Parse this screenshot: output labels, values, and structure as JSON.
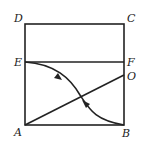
{
  "diagram": {
    "points": {
      "A": {
        "label": "A",
        "x": 25,
        "y": 125
      },
      "B": {
        "label": "B",
        "x": 124,
        "y": 125
      },
      "C": {
        "label": "C",
        "x": 124,
        "y": 24
      },
      "D": {
        "label": "D",
        "x": 25,
        "y": 24
      },
      "E": {
        "label": "E",
        "x": 25,
        "y": 62
      },
      "F": {
        "label": "F",
        "x": 124,
        "y": 62
      },
      "O": {
        "label": "O",
        "x": 124,
        "y": 75
      }
    },
    "segments": [
      "AB",
      "BC",
      "CD",
      "DA",
      "EF",
      "AO"
    ],
    "curve": {
      "from": "B",
      "to": "E",
      "arrow_direction": "B to E"
    }
  }
}
